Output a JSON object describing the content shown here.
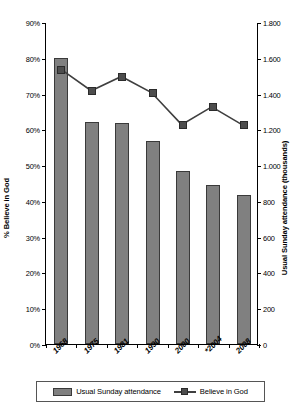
{
  "chart_data": {
    "type": "bar",
    "title": "",
    "subtitle": "",
    "categories": [
      "1968",
      "1975",
      "1981",
      "1990",
      "2000",
      "*2004",
      "2008"
    ],
    "series": [
      {
        "name": "Usual Sunday attendance",
        "type": "bar",
        "axis": "right",
        "unit": "thousands",
        "values": [
          1600,
          1240,
          1235,
          1135,
          965,
          890,
          835
        ]
      },
      {
        "name": "Believe in God",
        "type": "line",
        "axis": "left",
        "unit": "percent",
        "values": [
          77,
          71,
          75,
          70.5,
          61.5,
          66.5,
          61.5
        ]
      }
    ],
    "xlabel": "",
    "ylabel_left": "% Believe in God",
    "ylabel_right": "Usual Sunday attendance (thousands)",
    "ylim_left": [
      0,
      90
    ],
    "ylim_right": [
      0,
      1800
    ],
    "ytick_labels_left": [
      "0%",
      "10%",
      "20%",
      "30%",
      "40%",
      "50%",
      "60%",
      "70%",
      "80%",
      "90%"
    ],
    "ytick_values_left": [
      0,
      10,
      20,
      30,
      40,
      50,
      60,
      70,
      80,
      90
    ],
    "ytick_labels_right": [
      "0",
      "200",
      "400",
      "600",
      "800",
      "1.000",
      "1.200",
      "1.400",
      "1.600",
      "1.800"
    ],
    "ytick_values_right": [
      0,
      200,
      400,
      600,
      800,
      1000,
      1200,
      1400,
      1600,
      1800
    ],
    "grid": false,
    "legend_position": "bottom",
    "colors": {
      "bar_fill": "#808080",
      "bar_border": "#3a3a3a",
      "line": "#3f3f3f",
      "marker": "#4d4d4d",
      "axis": "#000000",
      "background": "#ffffff"
    }
  },
  "legend": {
    "items": [
      {
        "label": "Usual Sunday attendance",
        "swatch": "bar-swatch"
      },
      {
        "label": "Believe in God",
        "swatch": "line-marker-swatch"
      }
    ]
  }
}
